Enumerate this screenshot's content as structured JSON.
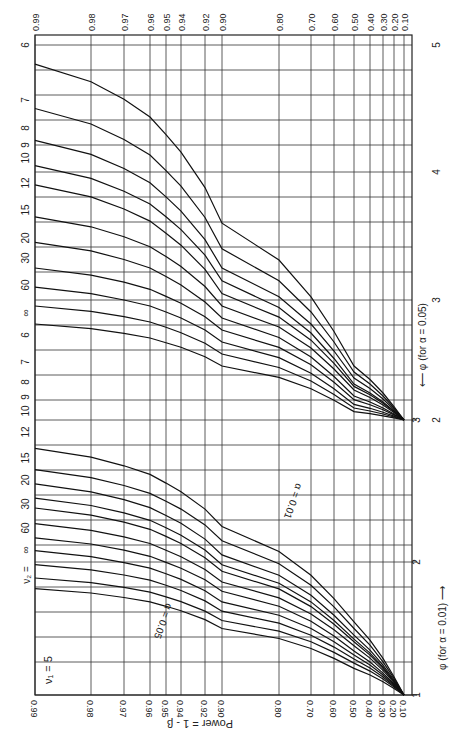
{
  "chart_data": {
    "type": "line",
    "orientation": "rotated 90 degrees clockwise",
    "nu1_label": "ν₁ = 5",
    "nu2_label": "ν₂ =",
    "ylabel": "Power = 1 - β",
    "xlabel_alpha01": "φ (for α = 0.01) ⟶",
    "xlabel_alpha05": "⟵ φ (for α = 0.05)",
    "alpha_labels": [
      "α = 0.05",
      "α = 0.01"
    ],
    "power_ticks": [
      "0.99",
      "0.98",
      "0.97",
      "0.96",
      "0.95",
      "0.94",
      "0.92",
      "0.90",
      "0.80",
      "0.70",
      "0.60",
      "0.50",
      "0.40",
      "0.30",
      "0.20",
      "0.10"
    ],
    "power_tick_values": [
      0.99,
      0.98,
      0.97,
      0.96,
      0.95,
      0.94,
      0.92,
      0.9,
      0.8,
      0.7,
      0.6,
      0.5,
      0.4,
      0.3,
      0.2,
      0.1
    ],
    "phi_ticks_alpha01": [
      "1",
      "2",
      "3"
    ],
    "phi_ticks_alpha05": [
      "1",
      "2",
      "3",
      "4",
      "5"
    ],
    "xlim_alpha01": [
      1,
      5
    ],
    "xlim_alpha05": [
      1,
      6
    ],
    "ylim": [
      0.1,
      0.99
    ],
    "grid": true,
    "nu2_values": [
      "6",
      "7",
      "8",
      "9",
      "10",
      "12",
      "15",
      "20",
      "30",
      "60",
      "∞"
    ],
    "series": [
      {
        "name": "α=0.05, ν2=6",
        "alpha": 0.05,
        "nu2": "6",
        "phi_at_power": {
          "0.10": 2.0,
          "0.50": 2.45,
          "0.90": 3.6,
          "0.99": 4.85
        }
      },
      {
        "name": "α=0.05, ν2=7",
        "alpha": 0.05,
        "nu2": "7",
        "phi_at_power": {
          "0.10": 2.0,
          "0.50": 2.4,
          "0.90": 3.4,
          "0.99": 4.5
        }
      },
      {
        "name": "α=0.05, ν2=8",
        "alpha": 0.05,
        "nu2": "8",
        "phi_at_power": {
          "0.10": 2.0,
          "0.50": 2.35,
          "0.90": 3.25,
          "0.99": 4.25
        }
      },
      {
        "name": "α=0.05, ν2=9",
        "alpha": 0.05,
        "nu2": "9",
        "phi_at_power": {
          "0.10": 2.0,
          "0.50": 2.3,
          "0.90": 3.15,
          "0.99": 4.05
        }
      },
      {
        "name": "α=0.05, ν2=10",
        "alpha": 0.05,
        "nu2": "10",
        "phi_at_power": {
          "0.10": 2.0,
          "0.50": 2.28,
          "0.90": 3.05,
          "0.99": 3.9
        }
      },
      {
        "name": "α=0.05, ν2=12",
        "alpha": 0.05,
        "nu2": "12",
        "phi_at_power": {
          "0.10": 2.0,
          "0.50": 2.25,
          "0.90": 2.95,
          "0.99": 3.65
        }
      },
      {
        "name": "α=0.05, ν2=15",
        "alpha": 0.05,
        "nu2": "15",
        "phi_at_power": {
          "0.10": 2.0,
          "0.50": 2.2,
          "0.90": 2.85,
          "0.99": 3.45
        }
      },
      {
        "name": "α=0.05, ν2=20",
        "alpha": 0.05,
        "nu2": "20",
        "phi_at_power": {
          "0.10": 2.0,
          "0.50": 2.17,
          "0.90": 2.75,
          "0.99": 3.25
        }
      },
      {
        "name": "α=0.05, ν2=30",
        "alpha": 0.05,
        "nu2": "30",
        "phi_at_power": {
          "0.10": 2.0,
          "0.50": 2.13,
          "0.90": 2.65,
          "0.99": 3.1
        }
      },
      {
        "name": "α=0.05, ν2=60",
        "alpha": 0.05,
        "nu2": "60",
        "phi_at_power": {
          "0.10": 2.0,
          "0.50": 2.1,
          "0.90": 2.55,
          "0.99": 2.95
        }
      },
      {
        "name": "α=0.05, ν2=∞",
        "alpha": 0.05,
        "nu2": "∞",
        "phi_at_power": {
          "0.10": 2.0,
          "0.50": 2.07,
          "0.90": 2.45,
          "0.99": 2.8
        }
      },
      {
        "name": "α=0.01, ν2=6",
        "alpha": 0.01,
        "nu2": "6",
        "phi_at_power": {
          "0.10": 1.0,
          "0.50": 1.55,
          "0.90": 2.25,
          "0.99": 2.8
        }
      },
      {
        "name": "α=0.01, ν2=7",
        "alpha": 0.01,
        "nu2": "7",
        "phi_at_power": {
          "0.10": 1.0,
          "0.50": 1.5,
          "0.90": 2.15,
          "0.99": 2.65
        }
      },
      {
        "name": "α=0.01, ν2=8",
        "alpha": 0.01,
        "nu2": "8",
        "phi_at_power": {
          "0.10": 1.0,
          "0.50": 1.45,
          "0.90": 2.05,
          "0.99": 2.55
        }
      },
      {
        "name": "α=0.01, ν2=9",
        "alpha": 0.01,
        "nu2": "9",
        "phi_at_power": {
          "0.10": 1.0,
          "0.50": 1.42,
          "0.90": 1.98,
          "0.99": 2.45
        }
      },
      {
        "name": "α=0.01, ν2=10",
        "alpha": 0.01,
        "nu2": "10",
        "phi_at_power": {
          "0.10": 1.0,
          "0.50": 1.4,
          "0.90": 1.93,
          "0.99": 2.38
        }
      },
      {
        "name": "α=0.01, ν2=12",
        "alpha": 0.01,
        "nu2": "12",
        "phi_at_power": {
          "0.10": 1.0,
          "0.50": 1.37,
          "0.90": 1.85,
          "0.99": 2.27
        }
      },
      {
        "name": "α=0.01, ν2=15",
        "alpha": 0.01,
        "nu2": "15",
        "phi_at_power": {
          "0.10": 1.0,
          "0.50": 1.33,
          "0.90": 1.78,
          "0.99": 2.17
        }
      },
      {
        "name": "α=0.01, ν2=20",
        "alpha": 0.01,
        "nu2": "20",
        "phi_at_power": {
          "0.10": 1.0,
          "0.50": 1.3,
          "0.90": 1.7,
          "0.99": 2.08
        }
      },
      {
        "name": "α=0.01, ν2=30",
        "alpha": 0.01,
        "nu2": "30",
        "phi_at_power": {
          "0.10": 1.0,
          "0.50": 1.27,
          "0.90": 1.63,
          "0.99": 1.98
        }
      },
      {
        "name": "α=0.01, ν2=60",
        "alpha": 0.01,
        "nu2": "60",
        "phi_at_power": {
          "0.10": 1.0,
          "0.50": 1.24,
          "0.90": 1.56,
          "0.99": 1.88
        }
      },
      {
        "name": "α=0.01, ν2=∞",
        "alpha": 0.01,
        "nu2": "∞",
        "phi_at_power": {
          "0.10": 1.0,
          "0.50": 1.2,
          "0.90": 1.5,
          "0.99": 1.8
        }
      }
    ]
  },
  "layout": {
    "plot": {
      "left": 35,
      "right": 412,
      "top": 35,
      "bottom": 695
    },
    "power_tick_x": [
      35,
      91,
      124,
      150,
      166,
      181,
      205,
      222,
      279,
      311,
      334,
      354,
      370,
      383,
      394,
      404
    ],
    "hgrid_y": [
      45,
      70,
      95,
      120,
      145,
      172,
      197,
      222,
      247,
      272,
      300,
      325,
      350,
      375,
      400,
      420,
      445,
      470,
      495,
      520,
      545,
      562,
      587,
      612,
      637,
      662,
      695
    ],
    "phi01_tick_y": {
      "1": 695,
      "2": 562,
      "3": 420
    },
    "phi05_tick_y": {
      "1": 562,
      "2": 420,
      "3": 300,
      "4": 172,
      "5": 45
    },
    "label_nu2_05_y": [
      45,
      100,
      128,
      145,
      158,
      183,
      210,
      238,
      258,
      285,
      313
    ],
    "label_nu2_01_y": [
      335,
      362,
      382,
      397,
      411,
      432,
      458,
      480,
      504,
      528,
      550
    ]
  }
}
